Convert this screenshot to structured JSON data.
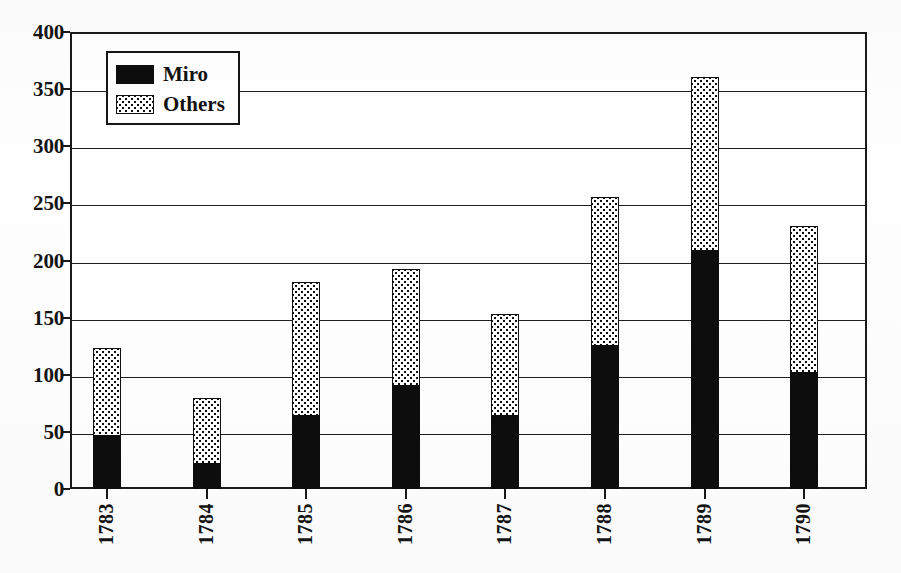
{
  "chart_data": {
    "type": "bar",
    "subtype": "stacked-vertical",
    "title": "",
    "xlabel": "",
    "ylabel": "",
    "categories": [
      "1783",
      "1784",
      "1785",
      "1786",
      "1787",
      "1788",
      "1789",
      "1790"
    ],
    "series": [
      {
        "name": "Miro",
        "fill": "solid-black",
        "values": [
          47,
          23,
          65,
          91,
          65,
          126,
          209,
          102
        ]
      },
      {
        "name": "Others",
        "fill": "white-dotted",
        "values": [
          76,
          57,
          116,
          102,
          88,
          130,
          152,
          128
        ]
      }
    ],
    "totals": [
      123,
      80,
      181,
      193,
      153,
      256,
      361,
      230
    ],
    "ylim": [
      0,
      400
    ],
    "ytick_labels": [
      "0",
      "50",
      "100",
      "150",
      "200",
      "250",
      "300",
      "350",
      "400"
    ],
    "ytick_values": [
      0,
      50,
      100,
      150,
      200,
      250,
      300,
      350,
      400
    ],
    "ytick_step": 50,
    "grid": "horizontal",
    "legend_position": "top-left-inside",
    "colors": {
      "miro": "#0d0d0d",
      "others_fill": "#ffffff",
      "others_dots": "#0f0f0f",
      "axis": "#1a1a1a",
      "grid": "#1f1f1f",
      "text": "#141414",
      "background": "#ffffff"
    }
  },
  "legend": {
    "items": [
      {
        "label": "Miro",
        "swatch": "solid-black-swatch"
      },
      {
        "label": "Others",
        "swatch": "dotted-white-swatch"
      }
    ]
  },
  "axes": {
    "y": {
      "labels": [
        "400",
        "350",
        "300",
        "250",
        "200",
        "150",
        "100",
        "50",
        "0"
      ]
    },
    "x": {
      "labels": [
        "1783",
        "1784",
        "1785",
        "1786",
        "1787",
        "1788",
        "1789",
        "1790"
      ]
    }
  }
}
